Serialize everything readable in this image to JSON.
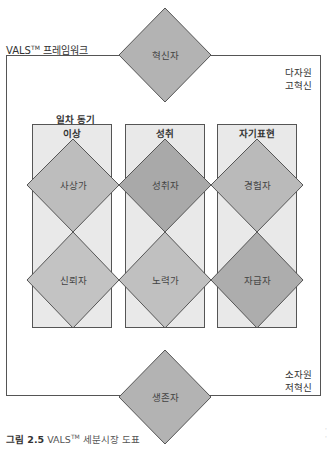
{
  "framework": {
    "title": "VALS",
    "title_tm": "TM",
    "title_suffix": " 프레임워크",
    "top_right_label": [
      "다자원",
      "고혁신"
    ],
    "bottom_right_label": [
      "소자원",
      "저혁신"
    ]
  },
  "motivation": {
    "label": "일차 동기",
    "columns": [
      {
        "label": "이상"
      },
      {
        "label": "성취"
      },
      {
        "label": "자기표현"
      }
    ]
  },
  "segments": {
    "top": {
      "label": "혁신자",
      "color": "#b3b3b3"
    },
    "row1": [
      {
        "label": "사상가",
        "color": "#bdbdbd"
      },
      {
        "label": "성취자",
        "color": "#a9a9a9"
      },
      {
        "label": "경험자",
        "color": "#bababa"
      }
    ],
    "row2": [
      {
        "label": "신뢰자",
        "color": "#c3c3c3"
      },
      {
        "label": "노력가",
        "color": "#c0c0c0"
      },
      {
        "label": "자급자",
        "color": "#adadad"
      }
    ],
    "bottom": {
      "label": "생존자",
      "color": "#b3b3b3"
    }
  },
  "caption": {
    "figure_no": "그림 2.5",
    "text_pre": " VALS",
    "tm": "TM",
    "text_post": " 세분시장 도표"
  },
  "colors": {
    "column_fill": "#e9e9e9",
    "stroke": "#555555"
  }
}
